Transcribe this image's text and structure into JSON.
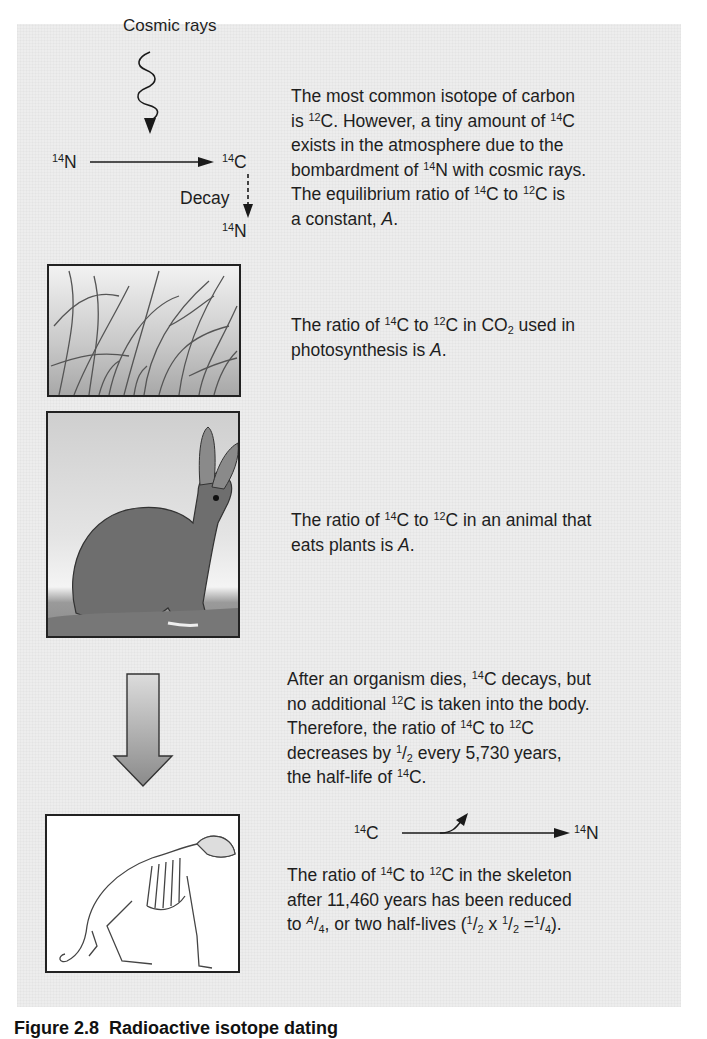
{
  "diagram": {
    "top": {
      "cosmic_rays_label": "Cosmic rays",
      "n14_left": {
        "mass": "14",
        "symbol": "N"
      },
      "c14": {
        "mass": "14",
        "symbol": "C"
      },
      "decay_label": "Decay",
      "n14_bottom": {
        "mass": "14",
        "symbol": "N"
      },
      "text": {
        "l1": "The most common isotope of carbon",
        "l2a": "is ",
        "l2m1": "12",
        "l2b": "C. However, a tiny amount of ",
        "l2m2": "14",
        "l2c": "C",
        "l3": "exists in the atmosphere due to the",
        "l4a": "bombardment of ",
        "l4m": "14",
        "l4b": "N with cosmic rays.",
        "l5a": "The equilibrium ratio of ",
        "l5m1": "14",
        "l5b": "C to ",
        "l5m2": "12",
        "l5c": "C is",
        "l6a": "a constant, ",
        "l6i": "A",
        "l6b": "."
      }
    },
    "plants": {
      "image": "grass-illustration",
      "text": {
        "l1a": "The ratio of ",
        "l1m1": "14",
        "l1b": "C to ",
        "l1m2": "12",
        "l1c": "C in CO",
        "l1sub": "2",
        "l1d": " used in",
        "l2a": "photosynthesis is ",
        "l2i": "A",
        "l2b": "."
      }
    },
    "animal": {
      "image": "rabbit-illustration",
      "text": {
        "l1a": "The ratio of ",
        "l1m1": "14",
        "l1b": "C to ",
        "l1m2": "12",
        "l1c": "C in an animal that",
        "l2a": "eats plants is ",
        "l2i": "A",
        "l2b": "."
      }
    },
    "death": {
      "icon": "down-arrow",
      "text": {
        "l1a": "After an organism dies, ",
        "l1m": "14",
        "l1b": "C decays, but",
        "l2a": "no additional ",
        "l2m": "12",
        "l2b": "C is taken into the body.",
        "l3a": "Therefore, the ratio of ",
        "l3m1": "14",
        "l3b": "C to ",
        "l3m2": "12",
        "l3c": "C",
        "l4a": "decreases by ",
        "l4num": "1",
        "l4den": "2",
        "l4b": " every 5,730 years,",
        "l5a": "the half-life of ",
        "l5m": "14",
        "l5b": "C."
      }
    },
    "skeleton": {
      "image": "rabbit-skeleton-illustration",
      "reaction": {
        "from": {
          "mass": "14",
          "symbol": "C"
        },
        "to": {
          "mass": "14",
          "symbol": "N"
        }
      },
      "text": {
        "l1a": "The ratio of ",
        "l1m1": "14",
        "l1b": "C to ",
        "l1m2": "12",
        "l1c": "C in the skeleton",
        "l2": "after 11,460 years has been reduced",
        "l3a": "to ",
        "l3num": "A",
        "l3den": "4",
        "l3b": ", or two half-lives (",
        "f1n": "1",
        "f1d": "2",
        "x": " x ",
        "f2n": "1",
        "f2d": "2",
        "eq": " =",
        "f3n": "1",
        "f3d": "4",
        "l3c": ")."
      }
    }
  },
  "caption": {
    "number": "Figure 2.8",
    "title": "Radioactive isotope dating"
  },
  "colors": {
    "panel_bg": "#ededed",
    "text": "#1e1e1e",
    "arrow_gradient_top": "#dcdcdc",
    "arrow_gradient_bottom": "#8a8a8a"
  }
}
